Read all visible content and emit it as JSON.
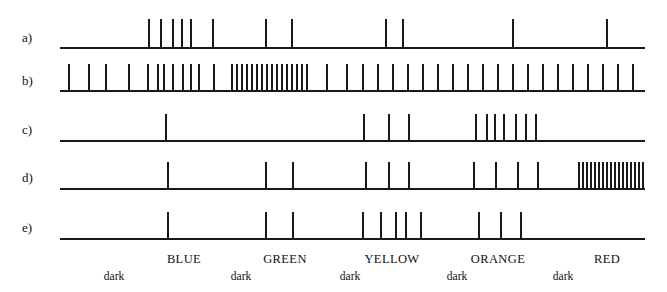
{
  "figure": {
    "type": "spike-raster",
    "width": 667,
    "height": 292,
    "ink_color": "#1a1a1a",
    "background_color": "#ffffff",
    "axis": {
      "x_start": 60,
      "x_end": 645
    },
    "rows": [
      {
        "label": "a)",
        "label_x": 22,
        "label_y": 30,
        "baseline_y": 47,
        "spike_height": 28,
        "spikes": [
          148,
          160,
          172,
          181,
          190,
          212,
          265,
          291,
          385,
          402,
          512,
          606
        ]
      },
      {
        "label": "b)",
        "label_x": 22,
        "label_y": 73,
        "baseline_y": 90,
        "spike_height": 26,
        "spikes": [
          68,
          88,
          105,
          128,
          147,
          157,
          163,
          172,
          182,
          190,
          198,
          213,
          231,
          236,
          241,
          246,
          251,
          256,
          261,
          266,
          271,
          276,
          281,
          286,
          291,
          296,
          301,
          306,
          326,
          346,
          362,
          377,
          392,
          407,
          422,
          437,
          452,
          467,
          482,
          497,
          512,
          527,
          542,
          557,
          572,
          587,
          602,
          617,
          632
        ]
      },
      {
        "label": "c)",
        "label_x": 22,
        "label_y": 122,
        "baseline_y": 140,
        "spike_height": 26,
        "spikes": [
          165,
          363,
          388,
          408,
          475,
          486,
          494,
          503,
          515,
          525,
          535
        ]
      },
      {
        "label": "d)",
        "label_x": 22,
        "label_y": 170,
        "baseline_y": 188,
        "spike_height": 26,
        "spikes": [
          167,
          265,
          292,
          365,
          388,
          408,
          473,
          495,
          517,
          537,
          578,
          582,
          586,
          590,
          594,
          598,
          602,
          606,
          610,
          614,
          618,
          622,
          626,
          630,
          634,
          638,
          642
        ]
      },
      {
        "label": "e)",
        "label_x": 22,
        "label_y": 220,
        "baseline_y": 238,
        "spike_height": 26,
        "spikes": [
          167,
          265,
          292,
          362,
          380,
          395,
          405,
          420,
          478,
          500,
          520
        ]
      }
    ],
    "color_labels": [
      {
        "text": "BLUE",
        "x": 184
      },
      {
        "text": "GREEN",
        "x": 285
      },
      {
        "text": "YELLOW",
        "x": 392
      },
      {
        "text": "ORANGE",
        "x": 498
      },
      {
        "text": "RED",
        "x": 607
      }
    ],
    "color_labels_y": 252,
    "dark_labels": [
      {
        "text": "dark",
        "x": 114
      },
      {
        "text": "dark",
        "x": 241
      },
      {
        "text": "dark",
        "x": 350
      },
      {
        "text": "dark",
        "x": 457
      },
      {
        "text": "dark",
        "x": 563
      }
    ],
    "dark_labels_y": 270
  }
}
